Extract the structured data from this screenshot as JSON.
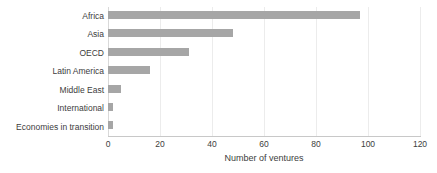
{
  "chart_data": {
    "type": "bar",
    "orientation": "horizontal",
    "title": "",
    "xlabel": "Number of ventures",
    "ylabel": "",
    "categories": [
      "Africa",
      "Asia",
      "OECD",
      "Latin America",
      "Middle East",
      "International",
      "Economies in transition"
    ],
    "values": [
      97,
      48,
      31,
      16,
      5,
      2,
      2
    ],
    "xlim": [
      0,
      120
    ],
    "xticks": [
      0,
      20,
      40,
      60,
      80,
      100,
      120
    ],
    "xtick_labels": [
      "0",
      "20",
      "40",
      "60",
      "80",
      "100",
      "120"
    ],
    "grid": "vertical",
    "legend": "none",
    "bar_color": "#a6a6a6",
    "gridline_color": "#ececec",
    "axis_color": "#c8c8c8",
    "text_color": "#3d3d3d",
    "background": "#ffffff"
  }
}
